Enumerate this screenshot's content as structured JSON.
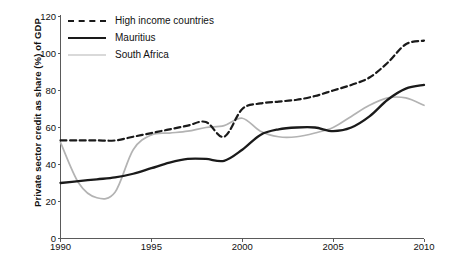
{
  "chart_data": {
    "type": "line",
    "title": "",
    "xlabel": "",
    "ylabel": "Private sector credit as share (%) of GDP",
    "xlim": [
      1990,
      2010
    ],
    "ylim": [
      0,
      120
    ],
    "yticks": [
      0,
      20,
      40,
      60,
      80,
      100,
      120
    ],
    "xticks": [
      1990,
      1995,
      2000,
      2005,
      2010
    ],
    "grid": false,
    "legend_position": "top-left",
    "x": [
      1990,
      1991,
      1992,
      1993,
      1994,
      1995,
      1996,
      1997,
      1998,
      1999,
      2000,
      2001,
      2002,
      2003,
      2004,
      2005,
      2006,
      2007,
      2008,
      2009,
      2010
    ],
    "series": [
      {
        "name": "High income countries",
        "style": "dashed",
        "color": "#1a1a1a",
        "values": [
          53,
          53,
          53,
          53,
          55,
          57,
          59,
          61,
          63,
          55,
          70,
          73,
          74,
          75,
          77,
          80,
          83,
          87,
          95,
          105,
          107
        ]
      },
      {
        "name": "Mauritius",
        "style": "solid",
        "color": "#1a1a1a",
        "values": [
          30,
          31,
          32,
          33,
          35,
          38,
          41,
          43,
          43,
          42,
          48,
          56,
          59,
          60,
          60,
          58,
          60,
          66,
          75,
          81,
          83
        ]
      },
      {
        "name": "South Africa",
        "style": "solid-grey",
        "color": "#b3b3b3",
        "values": [
          52,
          30,
          22,
          25,
          48,
          56,
          57,
          58,
          60,
          61,
          65,
          58,
          55,
          55,
          57,
          60,
          66,
          72,
          76,
          76,
          72
        ]
      }
    ]
  },
  "legend": {
    "items": [
      {
        "label": "High income countries",
        "key": "dashed-line-key"
      },
      {
        "label": "Mauritius",
        "key": "solid-line-key"
      },
      {
        "label": "South Africa",
        "key": "grey-line-key"
      }
    ]
  },
  "axes": {
    "y_title": "Private sector credit as share (%) of GDP",
    "y_tick_labels": [
      "0",
      "20",
      "40",
      "60",
      "80",
      "100",
      "120"
    ],
    "x_tick_labels": [
      "1990",
      "1995",
      "2000",
      "2005",
      "2010"
    ]
  },
  "caption": ""
}
